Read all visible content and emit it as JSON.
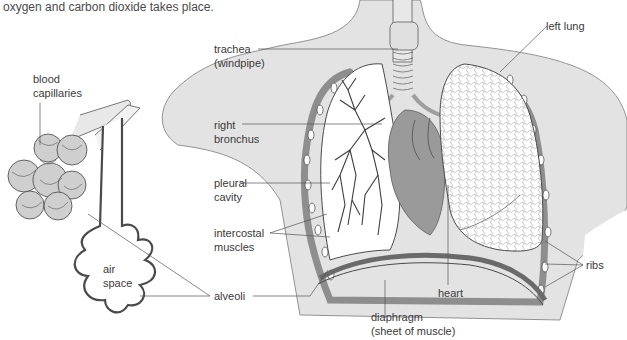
{
  "caption": "oxygen and carbon dioxide takes place.",
  "colors": {
    "body_fill": "#e3e3e3",
    "lung_fill": "#ffffff",
    "heart_fill": "#9a9a9a",
    "heart_dark": "#7e7e7e",
    "line": "#4a4a4a",
    "label_text": "#3a3a3a",
    "alveoli_fill": "#d4d4d4"
  },
  "alveolus_diagram": {
    "labels": {
      "blood_capillaries_1": "blood",
      "blood_capillaries_2": "capillaries",
      "air_space_1": "air",
      "air_space_2": "space"
    }
  },
  "chest_diagram": {
    "labels": {
      "trachea_1": "trachea",
      "trachea_2": "(windpipe)",
      "right_bronchus_1": "right",
      "right_bronchus_2": "bronchus",
      "pleural_cavity_1": "pleural",
      "pleural_cavity_2": "cavity",
      "intercostal_1": "intercostal",
      "intercostal_2": "muscles",
      "alveoli": "alveoli",
      "left_lung": "left lung",
      "heart": "heart",
      "diaphragm_1": "diaphragm",
      "diaphragm_2": "(sheet of muscle)",
      "ribs": "ribs"
    }
  }
}
